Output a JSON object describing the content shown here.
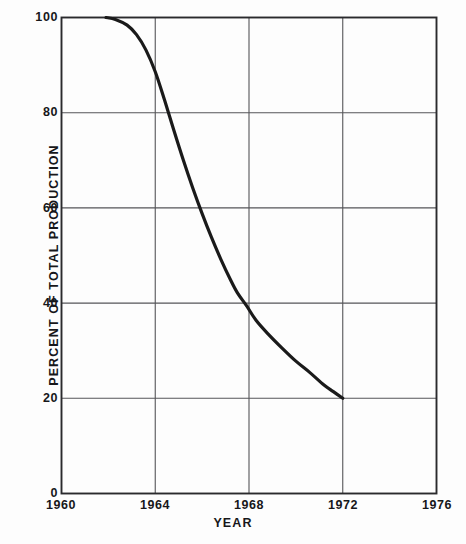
{
  "figure": {
    "background_color": "#fdfdfd",
    "line_color": "#1a1a1a",
    "grid_color": "#555558",
    "axis_color": "#2a2a2d",
    "text_color": "#17171a"
  },
  "axes": {
    "y_title": "PERCENT OF TOTAL PRODUCTION",
    "x_title": "YEAR",
    "y_ticks": [
      "0",
      "20",
      "40",
      "60",
      "80",
      "100"
    ],
    "x_ticks": [
      "1960",
      "1964",
      "1968",
      "1972",
      "1976"
    ]
  },
  "chart_data": {
    "type": "line",
    "title": "",
    "subtitle": "",
    "xlabel": "YEAR",
    "ylabel": "PERCENT OF TOTAL PRODUCTION",
    "xlim": [
      1960,
      1976
    ],
    "ylim": [
      0,
      100
    ],
    "xticks": [
      1960,
      1964,
      1968,
      1972,
      1976
    ],
    "yticks": [
      0,
      20,
      40,
      60,
      80,
      100
    ],
    "grid": true,
    "legend": null,
    "legend_position": "none",
    "annotations": [],
    "series": [
      {
        "name": "Percent of total production",
        "x": [
          1961.9,
          1962.3,
          1962.8,
          1963.2,
          1963.6,
          1964.0,
          1964.4,
          1964.8,
          1965.2,
          1965.6,
          1966.0,
          1966.4,
          1966.8,
          1967.2,
          1967.5,
          1967.9,
          1968.3,
          1968.8,
          1969.4,
          1970.0,
          1970.6,
          1971.2,
          1971.6,
          1972.0
        ],
        "y": [
          100.0,
          99.6,
          98.4,
          96.4,
          93.2,
          88.6,
          82.6,
          76.2,
          70.0,
          64.2,
          58.8,
          53.8,
          49.2,
          45.0,
          42.2,
          39.4,
          36.4,
          33.6,
          30.6,
          27.8,
          25.4,
          22.8,
          21.4,
          20.0
        ]
      }
    ]
  }
}
